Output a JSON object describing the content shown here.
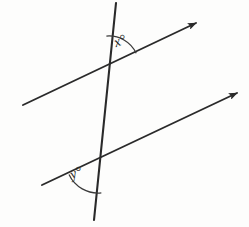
{
  "figure": {
    "background_color": "#fdfdfc",
    "stroke_color": "#2a2a2a",
    "arc_color": "#3a3a3a",
    "label_color": "#232323"
  },
  "labels": {
    "angle_x": "x°",
    "angle_y": "y°"
  },
  "chart_data": {
    "type": "diagram",
    "xlabel": "",
    "ylabel": "",
    "xlim": [
      0,
      249
    ],
    "ylim": [
      0,
      227
    ],
    "grid": false,
    "legend": null,
    "elements": [
      {
        "name": "upper-parallel-line",
        "kind": "ray",
        "from": [
          23,
          105
        ],
        "to": [
          196,
          23
        ],
        "arrow_at_end": true,
        "stroke": "#2a2a2a",
        "stroke_width": 1.9
      },
      {
        "name": "lower-parallel-line",
        "kind": "ray",
        "from": [
          42,
          185
        ],
        "to": [
          237,
          93
        ],
        "arrow_at_end": true,
        "stroke": "#2a2a2a",
        "stroke_width": 1.9
      },
      {
        "name": "transversal-line",
        "kind": "segment",
        "from": [
          116,
          3
        ],
        "to": [
          94,
          220
        ],
        "arrow_at_end": false,
        "stroke": "#2a2a2a",
        "stroke_width": 2.1
      }
    ],
    "intersections": [
      {
        "name": "upper-intersection",
        "point": [
          109,
          66
        ]
      },
      {
        "name": "lower-intersection",
        "point": [
          98,
          161
        ]
      }
    ],
    "angles": [
      {
        "name": "angle-x",
        "label": "x°",
        "vertex": [
          109,
          66
        ],
        "radius": 30,
        "start_deg": -25,
        "end_deg": -95,
        "description": "angle between upward transversal ray and rightward upper line ray"
      },
      {
        "name": "angle-y",
        "label": "y°",
        "vertex": [
          98,
          161
        ],
        "radius": 32,
        "start_deg": 84,
        "end_deg": 155,
        "description": "angle between leftward lower line ray and downward transversal ray"
      }
    ]
  }
}
